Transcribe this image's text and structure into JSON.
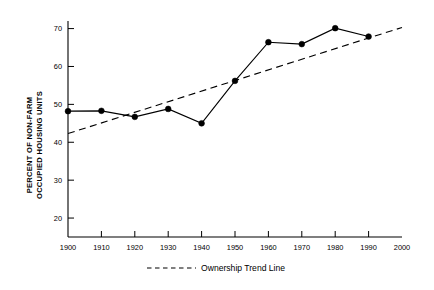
{
  "chart_data": {
    "type": "line",
    "title": "",
    "xlabel": "",
    "ylabel": "PERCENT OF NON-FARM OCCUPIED HOUSING UNITS",
    "ylabel_lines": [
      "PERCENT OF NON-FARM",
      "OCCUPIED HOUSING UNITS"
    ],
    "x": [
      1900,
      1910,
      1920,
      1930,
      1940,
      1950,
      1960,
      1970,
      1980,
      1990
    ],
    "categories": [
      "1900",
      "1910",
      "1920",
      "1930",
      "1940",
      "1950",
      "1960",
      "1970",
      "1980",
      "1990",
      "2000"
    ],
    "xtick_labels": [
      "1900",
      "1910",
      "1920",
      "1930",
      "1940",
      "1950",
      "1960",
      "1970",
      "1980",
      "1990",
      "2000"
    ],
    "ytick_labels": [
      "20",
      "30",
      "40",
      "50",
      "60",
      "70"
    ],
    "ytick_values": [
      20,
      30,
      40,
      50,
      60,
      70
    ],
    "xlim": [
      1900,
      2000
    ],
    "ylim": [
      15,
      72
    ],
    "grid": false,
    "legend_position": "bottom-center",
    "series": [
      {
        "name": "Percent of non-farm occupied housing units",
        "style": "solid-with-markers",
        "x": [
          1900,
          1910,
          1920,
          1930,
          1940,
          1950,
          1960,
          1970,
          1980,
          1990
        ],
        "values": [
          48.2,
          48.3,
          46.7,
          48.8,
          45.0,
          56.2,
          66.4,
          65.9,
          70.1,
          67.9
        ]
      },
      {
        "name": "Ownership Trend Line",
        "style": "dashed",
        "x": [
          1900,
          2000
        ],
        "values": [
          42.3,
          70.3
        ]
      }
    ],
    "legend": [
      {
        "label": "Ownership Trend Line",
        "style": "dashed"
      }
    ]
  }
}
